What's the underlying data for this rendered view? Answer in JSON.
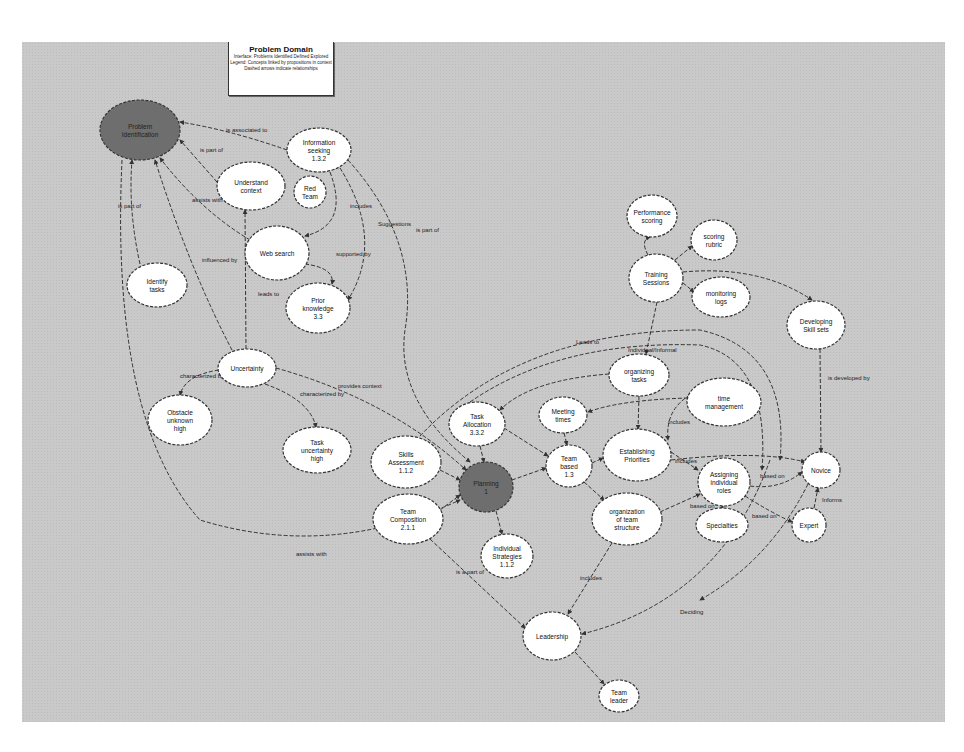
{
  "title_box": {
    "title": "Problem Domain",
    "lines": [
      "Interface: Problems Identified Defined Explored",
      "Legend: Concepts linked by propositions in context",
      "Dashed arrows indicate relationships"
    ]
  },
  "colors": {
    "canvas": "#c9c9c9",
    "node_fill": "#ffffff",
    "node_dark": "#6e6e6e",
    "stroke": "#333333"
  },
  "nodes": [
    {
      "id": "problem_identification",
      "label": [
        "Problem",
        "Identification"
      ],
      "cx": 140,
      "cy": 130,
      "rx": 40,
      "ry": 30,
      "dark": true
    },
    {
      "id": "information_seeking",
      "label": [
        "Information",
        "seeking",
        "1.3.2"
      ],
      "cx": 319,
      "cy": 150,
      "rx": 32,
      "ry": 22
    },
    {
      "id": "understand_context",
      "label": [
        "Understand",
        "context"
      ],
      "cx": 251,
      "cy": 186,
      "rx": 34,
      "ry": 24
    },
    {
      "id": "red_team",
      "label": [
        "Red",
        "Team"
      ],
      "cx": 310,
      "cy": 192,
      "rx": 16,
      "ry": 16
    },
    {
      "id": "identify_tasks",
      "label": [
        "Identify",
        "tasks"
      ],
      "cx": 157,
      "cy": 285,
      "rx": 30,
      "ry": 22
    },
    {
      "id": "web_search",
      "label": [
        "Web search"
      ],
      "cx": 277,
      "cy": 253,
      "rx": 32,
      "ry": 27
    },
    {
      "id": "prior_knowledge",
      "label": [
        "Prior",
        "knowledge",
        "3.3"
      ],
      "cx": 318,
      "cy": 308,
      "rx": 32,
      "ry": 25
    },
    {
      "id": "uncertainty",
      "label": [
        "Uncertainty"
      ],
      "cx": 247,
      "cy": 368,
      "rx": 29,
      "ry": 19
    },
    {
      "id": "obstacle_unknown_high",
      "label": [
        "Obstacle",
        "unknown",
        "high"
      ],
      "cx": 180,
      "cy": 420,
      "rx": 32,
      "ry": 25
    },
    {
      "id": "task_uncertainty_high",
      "label": [
        "Task",
        "uncertainty",
        "high"
      ],
      "cx": 317,
      "cy": 450,
      "rx": 34,
      "ry": 23
    },
    {
      "id": "skills_assessment",
      "label": [
        "Skills",
        "Assessment",
        "1.1.2"
      ],
      "cx": 406,
      "cy": 462,
      "rx": 35,
      "ry": 26
    },
    {
      "id": "task_allocation",
      "label": [
        "Task",
        "Allocation",
        "3.3.2"
      ],
      "cx": 477,
      "cy": 424,
      "rx": 28,
      "ry": 22
    },
    {
      "id": "planning",
      "label": [
        "Planning",
        "1"
      ],
      "cx": 486,
      "cy": 487,
      "rx": 27,
      "ry": 25,
      "dark": true
    },
    {
      "id": "team_composition",
      "label": [
        "Team",
        "Composition",
        "2.1.1"
      ],
      "cx": 408,
      "cy": 519,
      "rx": 35,
      "ry": 25
    },
    {
      "id": "individual_strategies",
      "label": [
        "Individual",
        "Strategies",
        "1.1.2"
      ],
      "cx": 507,
      "cy": 556,
      "rx": 26,
      "ry": 22
    },
    {
      "id": "meeting_times",
      "label": [
        "Meeting",
        "times"
      ],
      "cx": 563,
      "cy": 415,
      "rx": 24,
      "ry": 18
    },
    {
      "id": "team_based",
      "label": [
        "Team",
        "based",
        "1.3"
      ],
      "cx": 569,
      "cy": 466,
      "rx": 23,
      "ry": 21
    },
    {
      "id": "organizing_tasks",
      "label": [
        "organizing",
        "tasks"
      ],
      "cx": 639,
      "cy": 375,
      "rx": 30,
      "ry": 21
    },
    {
      "id": "time_management",
      "label": [
        "time",
        "management"
      ],
      "cx": 724,
      "cy": 402,
      "rx": 37,
      "ry": 24
    },
    {
      "id": "establishing_priorities",
      "label": [
        "Establishing",
        "Priorities"
      ],
      "cx": 637,
      "cy": 455,
      "rx": 34,
      "ry": 26
    },
    {
      "id": "organization_of_team_structure",
      "label": [
        "organization",
        "of team",
        "structure"
      ],
      "cx": 627,
      "cy": 519,
      "rx": 35,
      "ry": 26
    },
    {
      "id": "assigning_individual_roles",
      "label": [
        "Assigning",
        "individual",
        "roles"
      ],
      "cx": 724,
      "cy": 482,
      "rx": 26,
      "ry": 24
    },
    {
      "id": "specialties",
      "label": [
        "Specialties"
      ],
      "cx": 722,
      "cy": 525,
      "rx": 26,
      "ry": 17
    },
    {
      "id": "novice",
      "label": [
        "Novice"
      ],
      "cx": 821,
      "cy": 470,
      "rx": 19,
      "ry": 18
    },
    {
      "id": "expert",
      "label": [
        "Expert"
      ],
      "cx": 809,
      "cy": 525,
      "rx": 17,
      "ry": 17
    },
    {
      "id": "leadership",
      "label": [
        "Leadership"
      ],
      "cx": 552,
      "cy": 636,
      "rx": 29,
      "ry": 24
    },
    {
      "id": "team_leader",
      "label": [
        "Team",
        "leader"
      ],
      "cx": 619,
      "cy": 696,
      "rx": 20,
      "ry": 16
    },
    {
      "id": "performance_scoring",
      "label": [
        "Performance",
        "scoring"
      ],
      "cx": 652,
      "cy": 216,
      "rx": 25,
      "ry": 21
    },
    {
      "id": "scoring_rubric",
      "label": [
        "scoring",
        "rubric"
      ],
      "cx": 714,
      "cy": 240,
      "rx": 23,
      "ry": 20
    },
    {
      "id": "training_sessions",
      "label": [
        "Training",
        "Sessions"
      ],
      "cx": 656,
      "cy": 278,
      "rx": 27,
      "ry": 24
    },
    {
      "id": "monitoring_logs",
      "label": [
        "monitoring",
        "logs"
      ],
      "cx": 721,
      "cy": 297,
      "rx": 29,
      "ry": 20
    },
    {
      "id": "developing_skill_sets",
      "label": [
        "Developing",
        "Skill sets"
      ],
      "cx": 816,
      "cy": 325,
      "rx": 29,
      "ry": 24
    }
  ],
  "edges": [
    {
      "from": "information_seeking",
      "to": "problem_identification",
      "label": "is associated to",
      "path": "M287,150 Q230,130 180,122",
      "lx": 226,
      "ly": 132
    },
    {
      "from": "understand_context",
      "to": "problem_identification",
      "label": "is part of",
      "path": "M217,182 L180,140",
      "lx": 200,
      "ly": 152
    },
    {
      "from": "web_search",
      "to": "problem_identification",
      "label": "assists with",
      "path": "M250,240 Q200,210 160,158",
      "lx": 192,
      "ly": 202
    },
    {
      "from": "identify_tasks",
      "to": "problem_identification",
      "label": "is part of",
      "path": "M140,264 Q128,210 132,160",
      "lx": 118,
      "ly": 208
    },
    {
      "from": "uncertainty",
      "to": "problem_identification",
      "label": "influenced by",
      "path": "M232,350 Q190,270 155,160",
      "lx": 202,
      "ly": 262
    },
    {
      "from": "uncertainty",
      "to": "understand_context",
      "label": "leads to",
      "path": "M246,349 L245,210",
      "lx": 258,
      "ly": 296
    },
    {
      "from": "information_seeking",
      "to": "web_search",
      "label": "includes",
      "path": "M330,172 Q350,225 305,236",
      "lx": 350,
      "ly": 208
    },
    {
      "from": "web_search",
      "to": "prior_knowledge",
      "label": "supported by",
      "path": "M305,264 Q335,268 332,284",
      "lx": 336,
      "ly": 256
    },
    {
      "from": "information_seeking",
      "to": "prior_knowledge",
      "label": "Suggestions",
      "path": "M340,168 Q385,240 348,300",
      "lx": 378,
      "ly": 226
    },
    {
      "from": "information_seeking",
      "to": "planning",
      "label": "is part of",
      "path": "M348,160 Q420,240 405,330 Q395,400 470,462",
      "lx": 416,
      "ly": 232
    },
    {
      "from": "uncertainty",
      "to": "obstacle_unknown_high",
      "label": "characterized by",
      "path": "M219,370 Q185,375 180,395",
      "lx": 180,
      "ly": 378
    },
    {
      "from": "uncertainty",
      "to": "task_uncertainty_high",
      "label": "characterized by",
      "path": "M265,384 Q310,400 316,427",
      "lx": 300,
      "ly": 396
    },
    {
      "from": "uncertainty",
      "to": "planning",
      "label": "provides context",
      "path": "M276,368 Q390,400 466,470",
      "lx": 338,
      "ly": 388
    },
    {
      "from": "problem_identification",
      "to": "planning",
      "label": "assists with",
      "path": "M122,160 Q110,420 200,520 Q330,560 460,500",
      "lx": 296,
      "ly": 556
    },
    {
      "from": "skills_assessment",
      "to": "planning",
      "label": "",
      "path": "M440,470 L460,480",
      "lx": 0,
      "ly": 0
    },
    {
      "from": "team_composition",
      "to": "planning",
      "label": "",
      "path": "M440,510 L460,495",
      "lx": 0,
      "ly": 0
    },
    {
      "from": "task_allocation",
      "to": "planning",
      "label": "",
      "path": "M480,446 L484,462",
      "lx": 0,
      "ly": 0
    },
    {
      "from": "planning",
      "to": "individual_strategies",
      "label": "",
      "path": "M496,511 L502,534",
      "lx": 0,
      "ly": 0
    },
    {
      "from": "planning",
      "to": "team_based",
      "label": "",
      "path": "M512,480 L546,468",
      "lx": 0,
      "ly": 0
    },
    {
      "from": "task_allocation",
      "to": "team_based",
      "label": "",
      "path": "M504,428 L548,456",
      "lx": 0,
      "ly": 0
    },
    {
      "from": "meeting_times",
      "to": "team_based",
      "label": "",
      "path": "M564,433 L567,445",
      "lx": 0,
      "ly": 0
    },
    {
      "from": "team_based",
      "to": "establishing_priorities",
      "label": "",
      "path": "M592,463 L603,458",
      "lx": 0,
      "ly": 0
    },
    {
      "from": "team_based",
      "to": "organization_of_team_structure",
      "label": "",
      "path": "M584,482 L604,500",
      "lx": 0,
      "ly": 0
    },
    {
      "from": "organizing_tasks",
      "to": "establishing_priorities",
      "label": "",
      "path": "M639,396 L638,429",
      "lx": 0,
      "ly": 0
    },
    {
      "from": "organizing_tasks",
      "to": "task_allocation",
      "label": "",
      "path": "M609,374 Q530,380 500,410",
      "lx": 0,
      "ly": 0
    },
    {
      "from": "time_management",
      "to": "meeting_times",
      "label": "",
      "path": "M688,398 Q620,400 588,412",
      "lx": 0,
      "ly": 0
    },
    {
      "from": "time_management",
      "to": "establishing_priorities",
      "label": "includes",
      "path": "M690,395 Q665,410 668,440",
      "lx": 668,
      "ly": 424
    },
    {
      "from": "establishing_priorities",
      "to": "assigning_individual_roles",
      "label": "includes",
      "path": "M671,452 L698,470",
      "lx": 675,
      "ly": 463
    },
    {
      "from": "organization_of_team_structure",
      "to": "assigning_individual_roles",
      "label": "",
      "path": "M660,512 L700,494",
      "lx": 0,
      "ly": 0
    },
    {
      "from": "specialties",
      "to": "assigning_individual_roles",
      "label": "based on",
      "path": "M722,508 L723,506",
      "lx": 690,
      "ly": 508
    },
    {
      "from": "assigning_individual_roles",
      "to": "novice",
      "label": "based on",
      "path": "M750,486 Q780,490 802,472",
      "lx": 760,
      "ly": 478
    },
    {
      "from": "assigning_individual_roles",
      "to": "expert",
      "label": "based on",
      "path": "M745,496 Q770,512 792,522",
      "lx": 752,
      "ly": 518
    },
    {
      "from": "expert",
      "to": "novice",
      "label": "Informs",
      "path": "M814,508 L818,488",
      "lx": 822,
      "ly": 502
    },
    {
      "from": "training_sessions",
      "to": "performance_scoring",
      "label": "",
      "path": "M648,255 Q640,240 650,237",
      "lx": 0,
      "ly": 0
    },
    {
      "from": "training_sessions",
      "to": "scoring_rubric",
      "label": "",
      "path": "M675,260 L692,246",
      "lx": 0,
      "ly": 0
    },
    {
      "from": "training_sessions",
      "to": "monitoring_logs",
      "label": "",
      "path": "M683,283 L694,292",
      "lx": 0,
      "ly": 0
    },
    {
      "from": "training_sessions",
      "to": "developing_skill_sets",
      "label": "",
      "path": "M683,272 Q760,265 812,300",
      "lx": 0,
      "ly": 0
    },
    {
      "from": "training_sessions",
      "to": "organizing_tasks",
      "label": "",
      "path": "M657,302 L646,354",
      "lx": 0,
      "ly": 0
    },
    {
      "from": "developing_skill_sets",
      "to": "novice",
      "label": "is developed by",
      "path": "M820,349 L821,452",
      "lx": 828,
      "ly": 380
    },
    {
      "from": "team_composition",
      "to": "leadership",
      "label": "is a part of",
      "path": "M430,539 L525,628",
      "lx": 456,
      "ly": 574
    },
    {
      "from": "organization_of_team_structure",
      "to": "leadership",
      "label": "includes",
      "path": "M612,543 L568,614",
      "lx": 580,
      "ly": 580
    },
    {
      "from": "assigning_individual_roles",
      "to": "leadership",
      "label": "Deciding",
      "path": "M770,460 Q720,600 582,634",
      "lx": 680,
      "ly": 614
    },
    {
      "from": "leadership",
      "to": "team_leader",
      "label": "",
      "path": "M575,652 L604,684",
      "lx": 0,
      "ly": 0
    },
    {
      "from": "skills_assessment",
      "to": "novice",
      "label": "Leads to",
      "path": "M420,436 Q520,330 700,330 Q790,350 780,460",
      "lx": 576,
      "ly": 344
    },
    {
      "from": "task_allocation",
      "to": "novice",
      "label": "Individual/Informal",
      "path": "M470,402 Q560,340 700,345 Q770,360 762,470",
      "lx": 628,
      "ly": 352
    },
    {
      "from": "establishing_priorities",
      "to": "novice",
      "label": "",
      "path": "M671,460 Q760,450 805,462",
      "lx": 0,
      "ly": 0
    },
    {
      "from": "novice",
      "to": "leadership",
      "label": "",
      "path": "M808,484 Q770,560 700,600",
      "lx": 0,
      "ly": 0
    }
  ]
}
